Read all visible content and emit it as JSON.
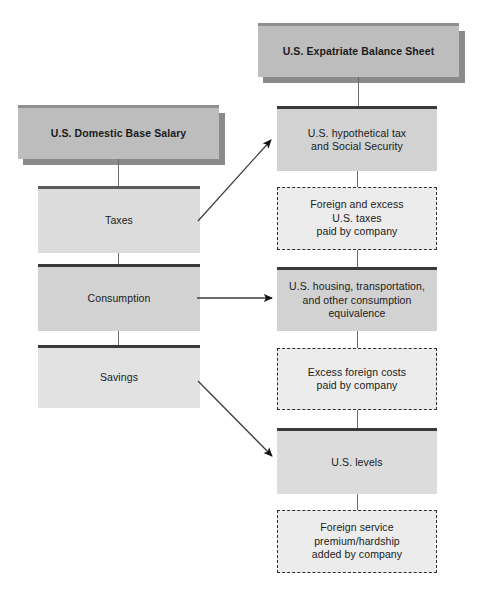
{
  "diagram": {
    "title": "U.S. Expatriate Balance Sheet",
    "left_column": {
      "header": "U.S. Domestic Base Salary",
      "segments": [
        {
          "label": "Taxes"
        },
        {
          "label": "Consumption"
        },
        {
          "label": "Savings"
        }
      ]
    },
    "right_column": {
      "header": "U.S. Expatriate Balance Sheet",
      "segments": [
        {
          "label": "U.S. hypothetical tax\nand Social Security",
          "style": "solid"
        },
        {
          "label": "Foreign and excess\nU.S. taxes\npaid by company",
          "style": "dashed"
        },
        {
          "label": "U.S. housing, transportation,\nand other consumption\nequivalence",
          "style": "solid"
        },
        {
          "label": "Excess foreign costs\npaid by company",
          "style": "dashed"
        },
        {
          "label": "U.S. levels",
          "style": "solid"
        },
        {
          "label": "Foreign service\npremium/hardship\nadded by company",
          "style": "dashed"
        }
      ]
    },
    "arrows": [
      {
        "name": "taxes-to-hypothetical-tax",
        "from": "Taxes",
        "to": "U.S. hypothetical tax and Social Security"
      },
      {
        "name": "consumption-to-housing",
        "from": "Consumption",
        "to": "U.S. housing, transportation, and other consumption equivalence"
      },
      {
        "name": "savings-to-us-levels",
        "from": "Savings",
        "to": "U.S. levels"
      }
    ],
    "colors": {
      "title_fill": "#bdbdbd",
      "title_shadow": "#8a8a8a",
      "solid_fill": "#e2e2e2",
      "dashed_fill": "#ececec",
      "border_dark": "#3a3a3a",
      "text": "#1a1a1a",
      "background": "#ffffff"
    }
  }
}
